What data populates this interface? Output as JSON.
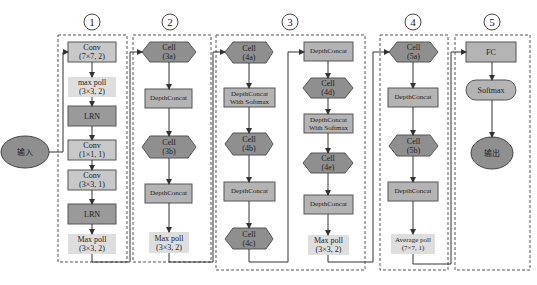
{
  "caption": "ー ー ー",
  "input": {
    "label": "输入"
  },
  "output": {
    "label": "输出"
  },
  "colors": {
    "dark": "#8f8f8f",
    "medium": "#b4b4b4",
    "light": "#dedede",
    "stroke": "#555555",
    "dashed": "#555555"
  },
  "sections": [
    {
      "number": "1",
      "nodes": [
        {
          "shape": "rect-medium",
          "label": "Conv\n(7×7, 2)"
        },
        {
          "shape": "rect-light",
          "label": "max poll\n(3×3, 2)"
        },
        {
          "shape": "rect-dark",
          "label": "LRN"
        },
        {
          "shape": "rect-medium",
          "label": "Conv\n(1×1, 1)"
        },
        {
          "shape": "rect-medium",
          "label": "Conv\n(3×3, 1)"
        },
        {
          "shape": "rect-dark",
          "label": "LRN"
        },
        {
          "shape": "rect-light",
          "label": "Max poll\n(3×3, 2)"
        }
      ]
    },
    {
      "number": "2",
      "nodes": [
        {
          "shape": "hexagon",
          "label": "Cell\n(3a)"
        },
        {
          "shape": "rect-medium",
          "label": "DepthConcat"
        },
        {
          "shape": "hexagon",
          "label": "Cell\n(3b)"
        },
        {
          "shape": "rect-medium",
          "label": "DepthConcat"
        },
        {
          "shape": "rect-light",
          "label": "Max poll\n(3×3, 2)"
        }
      ]
    },
    {
      "number": "3",
      "nodes": [
        {
          "shape": "hexagon",
          "label": "Cell\n(4a)"
        },
        {
          "shape": "rect-medium",
          "label": "DepthConcat\nWith Softmax"
        },
        {
          "shape": "hexagon",
          "label": "Cell\n(4b)"
        },
        {
          "shape": "rect-medium",
          "label": "DepthConcat"
        },
        {
          "shape": "hexagon",
          "label": "Cell\n(4c)"
        },
        {
          "shape": "rect-medium",
          "label": "DepthConcat"
        },
        {
          "shape": "hexagon",
          "label": "Cell\n(4d)"
        },
        {
          "shape": "rect-medium",
          "label": "DepthConcat\nWith Softmax"
        },
        {
          "shape": "hexagon",
          "label": "Cell\n(4e)"
        },
        {
          "shape": "rect-medium",
          "label": "DepthConcat"
        },
        {
          "shape": "rect-light",
          "label": "Max poll\n(3×3, 2)"
        }
      ]
    },
    {
      "number": "4",
      "nodes": [
        {
          "shape": "hexagon",
          "label": "Cell\n(5a)"
        },
        {
          "shape": "rect-medium",
          "label": "DepthConcat"
        },
        {
          "shape": "hexagon",
          "label": "Cell\n(5b)"
        },
        {
          "shape": "rect-medium",
          "label": "DepthConcat"
        },
        {
          "shape": "rect-light",
          "label": "Average poll\n(7×7, 1)"
        }
      ]
    },
    {
      "number": "5",
      "nodes": [
        {
          "shape": "rect-medium",
          "label": "FC"
        },
        {
          "shape": "pill",
          "label": "Softmax"
        }
      ]
    }
  ]
}
